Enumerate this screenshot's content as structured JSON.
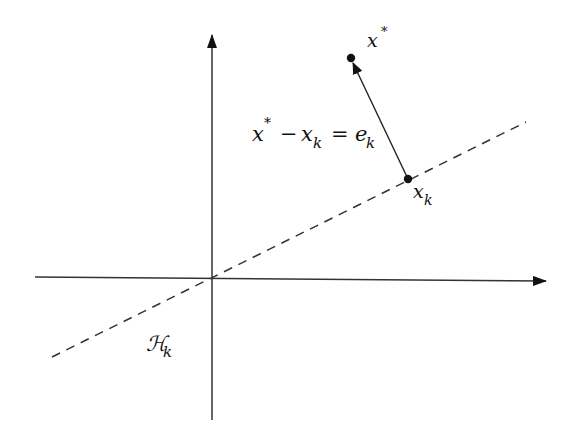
{
  "diagram": {
    "colors": {
      "ink": "#111111",
      "axis": "#333333",
      "background": "#ffffff"
    },
    "axes": {
      "horizontal": "x-axis",
      "vertical": "y-axis"
    },
    "hyperplane": {
      "label_main": "ℋ",
      "label_script": "𝒳",
      "label_sub": "k",
      "style": "dashed"
    },
    "points": {
      "solution": {
        "label": "x",
        "sup": "*"
      },
      "iterate": {
        "label": "x",
        "sub": "k"
      }
    },
    "equation": {
      "lhs_a": "x",
      "lhs_a_sup": "*",
      "minus": "−",
      "lhs_b": "x",
      "lhs_b_sub": "k",
      "equals": "=",
      "rhs": "e",
      "rhs_sub": "k"
    }
  }
}
